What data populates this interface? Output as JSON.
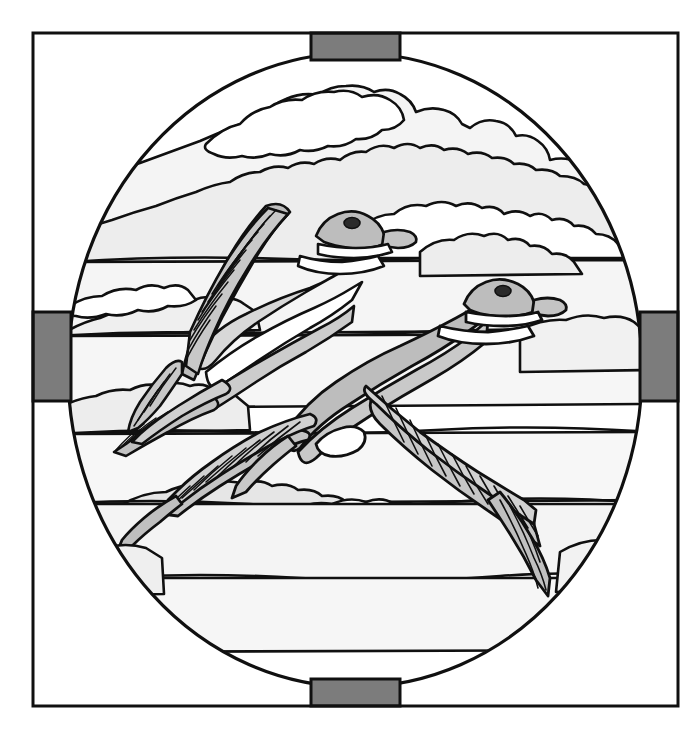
{
  "artwork": {
    "title": "Stained Glass Pattern - Two Ducks in Flight",
    "subject": "two-ducks-flying",
    "style": "stained-glass-leadline-pattern",
    "medium": "line-drawing",
    "background_color": "#ffffff",
    "line_color": "#101010"
  },
  "frame": {
    "name": "outer-square-frame",
    "x": 33,
    "y": 33,
    "width": 645,
    "height": 673,
    "stroke": "#101010",
    "stroke_width": 3,
    "fill": "none"
  },
  "oval": {
    "name": "central-oval-panel",
    "center_x": 355,
    "center_y": 370,
    "radius_x": 287,
    "radius_y": 317,
    "stroke": "#101010",
    "stroke_width": 3,
    "fill": "#ffffff"
  },
  "tabs": [
    {
      "name": "tab-top",
      "x": 311,
      "y": 33,
      "width": 89,
      "height": 27,
      "fill": "#7c7c7c"
    },
    {
      "name": "tab-bottom",
      "x": 311,
      "y": 679,
      "width": 89,
      "height": 27,
      "fill": "#7c7c7c"
    },
    {
      "name": "tab-left",
      "x": 33,
      "y": 312,
      "width": 38,
      "height": 89,
      "fill": "#7c7c7c"
    },
    {
      "name": "tab-right",
      "x": 640,
      "y": 312,
      "width": 38,
      "height": 89,
      "fill": "#7c7c7c"
    }
  ],
  "palette": {
    "white": "#ffffff",
    "cloud_light": "#f2f2f2",
    "cloud_mid": "#e6e6e6",
    "body_light": "#d8d8d8",
    "body_mid": "#bdbdbd",
    "body_dark": "#a8a8a8",
    "tab_gray": "#7c7c7c",
    "eye_dark": "#2a2a2a",
    "line": "#101010"
  },
  "ducks": [
    {
      "name": "duck-upper-left",
      "description": "Upper duck flying toward upper right, head at roughly (350,225), long hatched wing sweeping down-left",
      "eye_x": 352,
      "eye_y": 223,
      "head_fill": "#bdbdbd",
      "body_fill": "#d8d8d8",
      "wing_fill": "#bdbdbd"
    },
    {
      "name": "duck-lower-right",
      "description": "Lower duck flying toward right, head at roughly (500,293), broad hatched wings spread left and right",
      "eye_x": 503,
      "eye_y": 291,
      "head_fill": "#bdbdbd",
      "body_fill": "#bdbdbd",
      "wing_fill": "#c6c6c6"
    }
  ],
  "clouds": {
    "count": 12,
    "fill_light": "#f2f2f2",
    "fill_mid": "#e9e9e9",
    "description": "Layered horizontal cloud bands filling the oval behind and below the ducks"
  },
  "feathers": {
    "description": "Hatched primary and secondary feather strokes drawn as thin parallel leadlines on both wings of each duck",
    "stroke": "#101010",
    "stroke_width": 1.6
  }
}
